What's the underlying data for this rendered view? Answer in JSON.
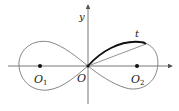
{
  "diagram": {
    "type": "lemniscate",
    "labels": {
      "y_axis": "y",
      "tangent": "t",
      "origin": "O",
      "focus_left": "O",
      "focus_left_sub": "1",
      "focus_right": "O",
      "focus_right_sub": "2"
    },
    "colors": {
      "curve": "#777777",
      "axis": "#555555",
      "highlight": "#111111",
      "point": "#111111"
    }
  }
}
